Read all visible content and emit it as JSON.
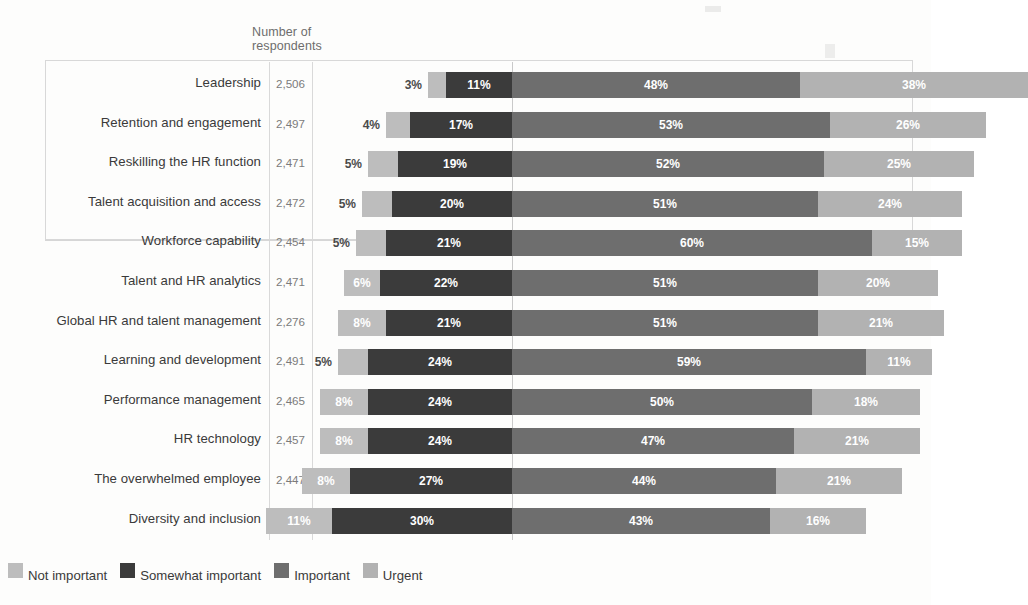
{
  "header": {
    "respondents_label": "Number of\nrespondents"
  },
  "legend": {
    "items": [
      {
        "label": "Not important",
        "color": "#bdbdbd",
        "key": "not_important"
      },
      {
        "label": "Somewhat important",
        "color": "#3b3b3b",
        "key": "somewhat_important"
      },
      {
        "label": "Important",
        "color": "#6e6e6e",
        "key": "important"
      },
      {
        "label": "Urgent",
        "color": "#b2b2b2",
        "key": "urgent"
      }
    ]
  },
  "highlight": {
    "rows": 4
  },
  "chart_data": {
    "type": "bar",
    "subtype": "stacked-horizontal-100pct",
    "title": "",
    "xlabel": "",
    "ylabel": "",
    "grid": true,
    "legend_position": "bottom-left",
    "align_boundary_after_series": "somewhat_important",
    "series": [
      {
        "name": "Not important",
        "values": [
          3,
          4,
          5,
          5,
          5,
          6,
          8,
          5,
          8,
          8,
          8,
          11
        ]
      },
      {
        "name": "Somewhat important",
        "values": [
          11,
          17,
          19,
          20,
          21,
          22,
          21,
          24,
          24,
          24,
          27,
          30
        ]
      },
      {
        "name": "Important",
        "values": [
          48,
          53,
          52,
          51,
          60,
          51,
          51,
          59,
          50,
          47,
          44,
          43
        ]
      },
      {
        "name": "Urgent",
        "values": [
          38,
          26,
          25,
          24,
          15,
          20,
          21,
          11,
          18,
          21,
          21,
          16
        ]
      }
    ],
    "categories": [
      "Leadership",
      "Retention and engagement",
      "Reskilling the HR function",
      "Talent acquisition and access",
      "Workforce capability",
      "Talent and HR analytics",
      "Global HR and talent management",
      "Learning and development",
      "Performance management",
      "HR technology",
      "The overwhelmed employee",
      "Diversity and inclusion"
    ],
    "respondents": [
      "2,506",
      "2,497",
      "2,471",
      "2,472",
      "2,454",
      "2,471",
      "2,276",
      "2,491",
      "2,465",
      "2,457",
      "2,447",
      "2,414"
    ]
  },
  "rows": [
    {
      "label": "Leadership",
      "count": "2,506",
      "not_important": "3%",
      "somewhat_important": "11%",
      "important": "48%",
      "urgent": "38%"
    },
    {
      "label": "Retention and engagement",
      "count": "2,497",
      "not_important": "4%",
      "somewhat_important": "17%",
      "important": "53%",
      "urgent": "26%"
    },
    {
      "label": "Reskilling the HR function",
      "count": "2,471",
      "not_important": "5%",
      "somewhat_important": "19%",
      "important": "52%",
      "urgent": "25%"
    },
    {
      "label": "Talent acquisition and access",
      "count": "2,472",
      "not_important": "5%",
      "somewhat_important": "20%",
      "important": "51%",
      "urgent": "24%"
    },
    {
      "label": "Workforce capability",
      "count": "2,454",
      "not_important": "5%",
      "somewhat_important": "21%",
      "important": "60%",
      "urgent": "15%"
    },
    {
      "label": "Talent and HR analytics",
      "count": "2,471",
      "not_important": "6%",
      "somewhat_important": "22%",
      "important": "51%",
      "urgent": "20%"
    },
    {
      "label": "Global HR and talent management",
      "count": "2,276",
      "not_important": "8%",
      "somewhat_important": "21%",
      "important": "51%",
      "urgent": "21%"
    },
    {
      "label": "Learning and development",
      "count": "2,491",
      "not_important": "5%",
      "somewhat_important": "24%",
      "important": "59%",
      "urgent": "11%"
    },
    {
      "label": "Performance management",
      "count": "2,465",
      "not_important": "8%",
      "somewhat_important": "24%",
      "important": "50%",
      "urgent": "18%"
    },
    {
      "label": "HR technology",
      "count": "2,457",
      "not_important": "8%",
      "somewhat_important": "24%",
      "important": "47%",
      "urgent": "21%"
    },
    {
      "label": "The overwhelmed employee",
      "count": "2,447",
      "not_important": "8%",
      "somewhat_important": "27%",
      "important": "44%",
      "urgent": "21%"
    },
    {
      "label": "Diversity and inclusion",
      "count": "2,414",
      "not_important": "11%",
      "somewhat_important": "30%",
      "important": "43%",
      "urgent": "16%"
    }
  ]
}
